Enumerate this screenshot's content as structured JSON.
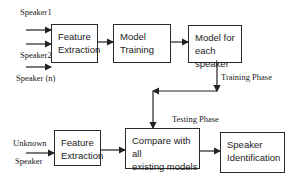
{
  "diagram": {
    "type": "flowchart",
    "inputs": {
      "training": [
        "Speaker1",
        "Speaker2",
        "Speaker (n)"
      ],
      "testing": [
        "Unknown",
        "Speaker"
      ]
    },
    "boxes": {
      "feature_extraction_train": [
        "Feature",
        "Extraction"
      ],
      "model_training": [
        "Model",
        "Training"
      ],
      "model_each_speaker": [
        "Model for",
        "each speaker"
      ],
      "feature_extraction_test": [
        "Feature",
        "Extraction"
      ],
      "compare_models": [
        "Compare with all",
        "existing models"
      ],
      "speaker_identification": [
        "Speaker",
        "Identification"
      ]
    },
    "labels": {
      "training_phase": "Training Phase",
      "testing_phase": "Testing Phase"
    },
    "edges": [
      [
        "Speaker1",
        "feature_extraction_train"
      ],
      [
        "Speaker2",
        "feature_extraction_train"
      ],
      [
        "Speaker (n)",
        "feature_extraction_train"
      ],
      [
        "feature_extraction_train",
        "model_training"
      ],
      [
        "model_training",
        "model_each_speaker"
      ],
      [
        "model_each_speaker",
        "compare_models"
      ],
      [
        "Unknown Speaker",
        "feature_extraction_test"
      ],
      [
        "feature_extraction_test",
        "compare_models"
      ],
      [
        "compare_models",
        "speaker_identification"
      ]
    ]
  }
}
